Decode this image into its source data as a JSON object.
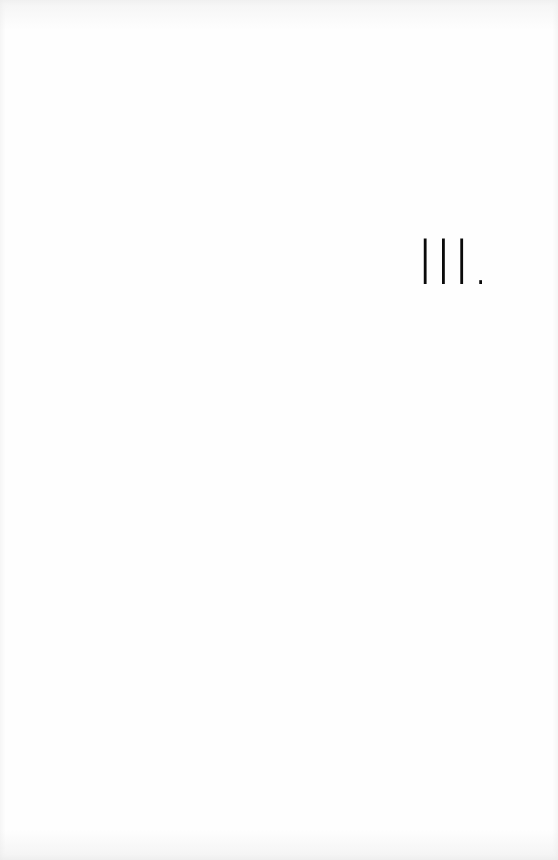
{
  "page": {
    "section_numeral": "III."
  }
}
